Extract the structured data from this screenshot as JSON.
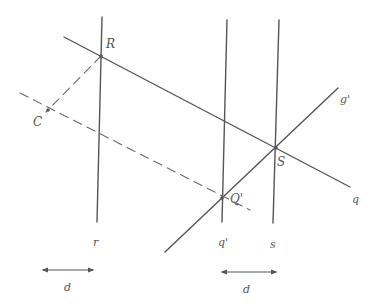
{
  "diagram": {
    "type": "geometry-construction",
    "colors": {
      "line": "#555555",
      "dashed": "#6a6a6a",
      "label": "#555555",
      "background": "#ffffff"
    },
    "points": [
      {
        "id": "R",
        "label": "R",
        "x": 101,
        "y": 56,
        "lx": 106,
        "ly": 48
      },
      {
        "id": "C",
        "label": "C",
        "x": 48,
        "y": 110,
        "lx": 33,
        "ly": 126
      },
      {
        "id": "S",
        "label": "S",
        "x": 276,
        "y": 148,
        "lx": 277,
        "ly": 166
      },
      {
        "id": "Q1",
        "label": "Q'",
        "x": 222,
        "y": 198,
        "lx": 230,
        "ly": 203
      }
    ],
    "lines": [
      {
        "id": "r",
        "label": "r",
        "x1": 102,
        "y1": 17,
        "x2": 97,
        "y2": 222,
        "style": "solid",
        "lx": 93,
        "ly": 246
      },
      {
        "id": "q-prime",
        "label": "q'",
        "x1": 227,
        "y1": 20,
        "x2": 222,
        "y2": 222,
        "style": "solid",
        "lx": 218,
        "ly": 246
      },
      {
        "id": "s",
        "label": "s",
        "x1": 279,
        "y1": 20,
        "x2": 273,
        "y2": 223,
        "style": "solid",
        "lx": 270,
        "ly": 248
      },
      {
        "id": "q",
        "label": "q",
        "x1": 64,
        "y1": 37,
        "x2": 350,
        "y2": 187,
        "style": "solid",
        "lx": 352,
        "ly": 203
      },
      {
        "id": "g-prime",
        "label": "g'",
        "x1": 165,
        "y1": 252,
        "x2": 338,
        "y2": 88,
        "style": "solid",
        "lx": 340,
        "ly": 103
      },
      {
        "id": "dash-main",
        "label": "",
        "x1": 20,
        "y1": 93,
        "x2": 250,
        "y2": 210,
        "style": "dashed"
      },
      {
        "id": "dash-RC",
        "label": "",
        "x1": 101,
        "y1": 56,
        "x2": 46,
        "y2": 112,
        "style": "dashed"
      }
    ],
    "dimensions": [
      {
        "id": "d-left",
        "label": "d",
        "x1": 43,
        "y1": 270,
        "x2": 93,
        "y2": 270,
        "lx": 64,
        "ly": 291
      },
      {
        "id": "d-right",
        "label": "d",
        "x1": 222,
        "y1": 272,
        "x2": 276,
        "y2": 272,
        "lx": 243,
        "ly": 293
      }
    ]
  }
}
